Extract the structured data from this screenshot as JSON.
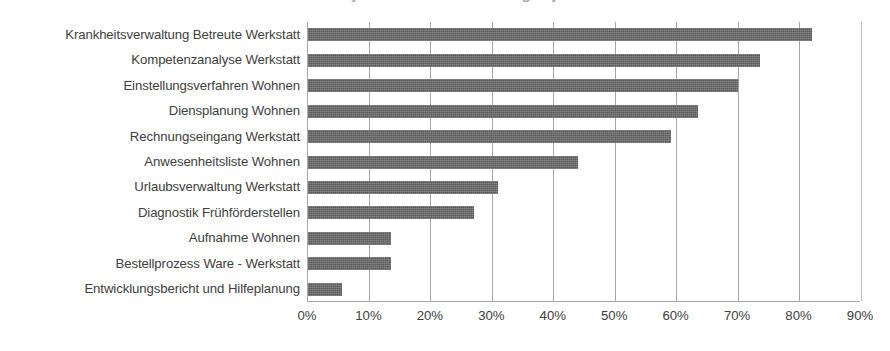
{
  "title_sliver": "Prozessanalyse – Anteil der Nennungen je Prozess",
  "chart_data": {
    "type": "bar",
    "orientation": "horizontal",
    "title": "",
    "xlabel": "",
    "ylabel": "",
    "xlim": [
      0,
      90
    ],
    "grid": true,
    "legend": "none",
    "value_suffix": "%",
    "bar_color": "#585858",
    "axis_color": "#a6a6a6",
    "label_color": "#404040",
    "categories": [
      "Krankheitsverwaltung Betreute Werkstatt",
      "Kompetenzanalyse Werkstatt",
      "Einstellungsverfahren Wohnen",
      "Diensplanung Wohnen",
      "Rechnungseingang Werkstatt",
      "Anwesenheitsliste Wohnen",
      "Urlaubsverwaltung  Werkstatt",
      "Diagnostik Frühförderstellen",
      "Aufnahme Wohnen",
      "Bestellprozess Ware - Werkstatt",
      "Entwicklungsbericht und Hilfeplanung"
    ],
    "values": [
      82,
      73.5,
      70,
      63.5,
      59,
      44,
      31,
      27,
      13.5,
      13.5,
      5.5
    ],
    "xticks": [
      0,
      10,
      20,
      30,
      40,
      50,
      60,
      70,
      80,
      90
    ],
    "xtick_labels": [
      "0%",
      "10%",
      "20%",
      "30%",
      "40%",
      "50%",
      "60%",
      "70%",
      "80%",
      "90%"
    ]
  }
}
